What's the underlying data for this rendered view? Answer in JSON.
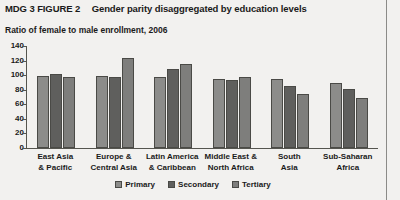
{
  "figure": {
    "label": "MDG 3 FIGURE 2",
    "title": "Gender parity disaggregated by education levels",
    "subtitle": "Ratio of female to male enrollment, 2006"
  },
  "legend": {
    "items": [
      {
        "label": "Primary",
        "color": "#8c8c8a",
        "icon": "legend-swatch-icon"
      },
      {
        "label": "Secondary",
        "color": "#5f5f5d",
        "icon": "legend-swatch-icon"
      },
      {
        "label": "Tertiary",
        "color": "#7e7e7c",
        "icon": "legend-swatch-icon"
      }
    ]
  },
  "chart_data": {
    "type": "bar",
    "title": "Gender parity disaggregated by education levels",
    "subtitle": "Ratio of female to male enrollment, 2006",
    "xlabel": "",
    "ylabel": "Ratio of female to male enrollment, 2006",
    "ylim": [
      0,
      140
    ],
    "yticks": [
      0,
      20,
      40,
      60,
      80,
      100,
      120,
      140
    ],
    "grid": false,
    "legend_position": "bottom-center",
    "categories": [
      "East Asia & Pacific",
      "Europe & Central Asia",
      "Latin America & Caribbean",
      "Middle East & North Africa",
      "South Asia",
      "Sub-Saharan Africa"
    ],
    "categories_lines": [
      [
        "East Asia",
        "& Pacific"
      ],
      [
        "Europe &",
        "Central Asia"
      ],
      [
        "Latin America",
        "& Caribbean"
      ],
      [
        "Middle East &",
        "North Africa"
      ],
      [
        "South",
        "Asia"
      ],
      [
        "Sub-Saharan",
        "Africa"
      ]
    ],
    "series": [
      {
        "name": "Primary",
        "color": "#8c8c8a",
        "values": [
          99,
          99,
          97,
          95,
          95,
          89
        ]
      },
      {
        "name": "Secondary",
        "color": "#5f5f5d",
        "values": [
          101,
          97,
          108,
          93,
          85,
          81
        ]
      },
      {
        "name": "Tertiary",
        "color": "#7e7e7c",
        "values": [
          98,
          123,
          116,
          97,
          74,
          69
        ]
      }
    ]
  }
}
